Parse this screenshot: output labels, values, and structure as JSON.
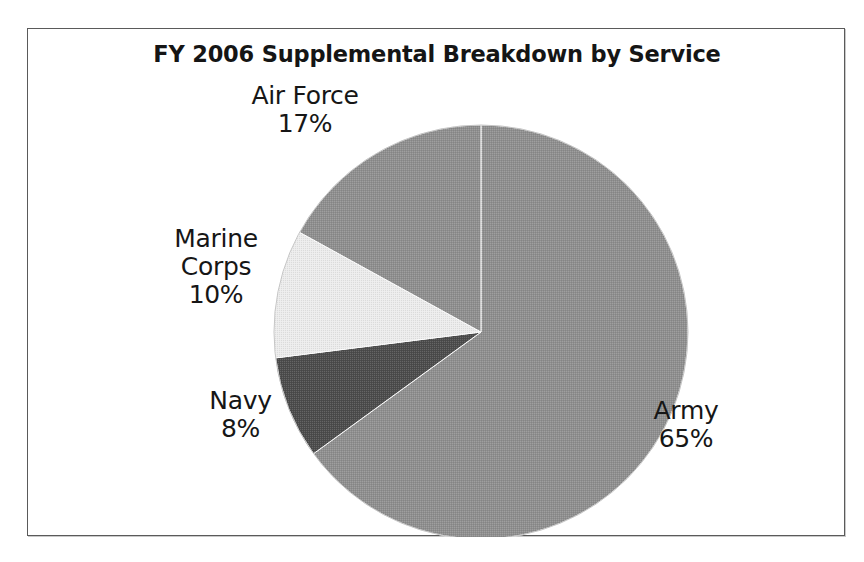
{
  "chart_data": {
    "type": "pie",
    "title": "FY 2006 Supplemental Breakdown by Service",
    "categories": [
      "Army",
      "Air Force",
      "Marine Corps",
      "Navy"
    ],
    "values": [
      65,
      17,
      10,
      8
    ],
    "value_suffix": "%",
    "labels": [
      {
        "name": "Army",
        "value": 65,
        "value_text": "65%",
        "color": "#8f8f8f"
      },
      {
        "name": "Air Force",
        "value": 17,
        "value_text": "17%",
        "color": "#8f8f8f"
      },
      {
        "name": "Marine Corps",
        "value": 10,
        "value_text": "10%",
        "color": "#ececec"
      },
      {
        "name": "Navy",
        "value": 8,
        "value_text": "8%",
        "color": "#4c4c4c"
      }
    ],
    "start_angle_deg": 0,
    "direction": "clockwise",
    "legend": "none",
    "grid": false,
    "xlabel": "",
    "ylabel": "",
    "colors": {
      "army": "#8f8f8f",
      "air_force": "#8f8f8f",
      "marine_corps": "#ececec",
      "navy": "#4c4c4c",
      "slice_outline": "#ffffff",
      "frame_border": "#5a5a5a",
      "background": "#ffffff",
      "text": "#161616"
    }
  },
  "chart": {
    "title": "FY 2006 Supplemental Breakdown by Service",
    "slices": {
      "army": {
        "name": "Army",
        "value_text": "65%"
      },
      "air_force": {
        "name_line1": "Air Force",
        "value_text": "17%"
      },
      "marine_corps": {
        "name_line1": "Marine",
        "name_line2": "Corps",
        "value_text": "10%"
      },
      "navy": {
        "name": "Navy",
        "value_text": "8%"
      }
    }
  }
}
